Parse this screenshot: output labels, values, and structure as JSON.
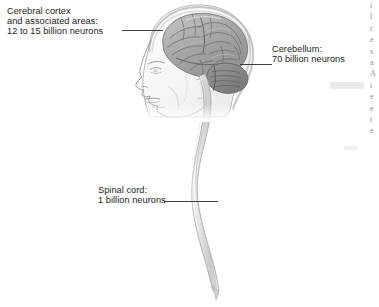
{
  "figure": {
    "type": "anatomical-diagram",
    "background_color": "#ffffff",
    "ink_color": "#1b1b1b"
  },
  "labels": {
    "cortex": {
      "name": "cerebral-cortex",
      "line1": "Cerebral cortex",
      "line2": "and associated areas:",
      "line3": "12 to 15 billion neurons"
    },
    "cerebellum": {
      "name": "cerebellum",
      "line1": "Cerebellum:",
      "line2": "70 billion neurons"
    },
    "spinal": {
      "name": "spinal-cord",
      "line1": "Spinal cord:",
      "line2": "1 billion neurons"
    }
  },
  "chart_data": {
    "type": "table",
    "categories": [
      "Cerebral cortex and associated areas",
      "Cerebellum",
      "Spinal cord"
    ],
    "values_text": [
      "12 to 15 billion neurons",
      "70 billion neurons",
      "1 billion neurons"
    ],
    "values_billions": [
      13.5,
      70,
      1
    ],
    "units": "billion neurons",
    "xlabel": "",
    "ylabel": "Neurons (billions)",
    "legend": []
  },
  "illustration": {
    "subject": "left-facing human head profile with brain, cerebellum and spinal cord",
    "parts": [
      "head-profile",
      "cerebrum",
      "cerebellum",
      "brainstem",
      "spinal-cord",
      "skull-outline"
    ],
    "cerebrum_fill": "#a9a9a9",
    "cerebellum_fill": "#8c8c8c",
    "cord_fill": "#d9d9d9",
    "outline_color": "#777777"
  },
  "edge_column": {
    "note": "illegible cut-off text column from facing page",
    "lines": [
      "i",
      "l",
      "r",
      "e",
      "s",
      "a",
      "A",
      "t",
      "e",
      "e",
      "t",
      "e"
    ]
  }
}
